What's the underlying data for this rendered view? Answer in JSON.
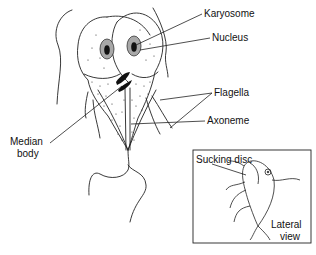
{
  "diagram": {
    "labels": {
      "karyosome": "Karyosome",
      "nucleus": "Nucleus",
      "flagella": "Flagella",
      "axoneme": "Axoneme",
      "median_body_line1": "Median",
      "median_body_line2": "body",
      "sucking_disc": "Sucking disc",
      "lateral_line1": "Lateral",
      "lateral_line2": "view"
    },
    "colors": {
      "stroke": "#222222",
      "nucleus_ring": "#9a9a9a",
      "karyosome": "#111111",
      "background": "#ffffff"
    }
  }
}
